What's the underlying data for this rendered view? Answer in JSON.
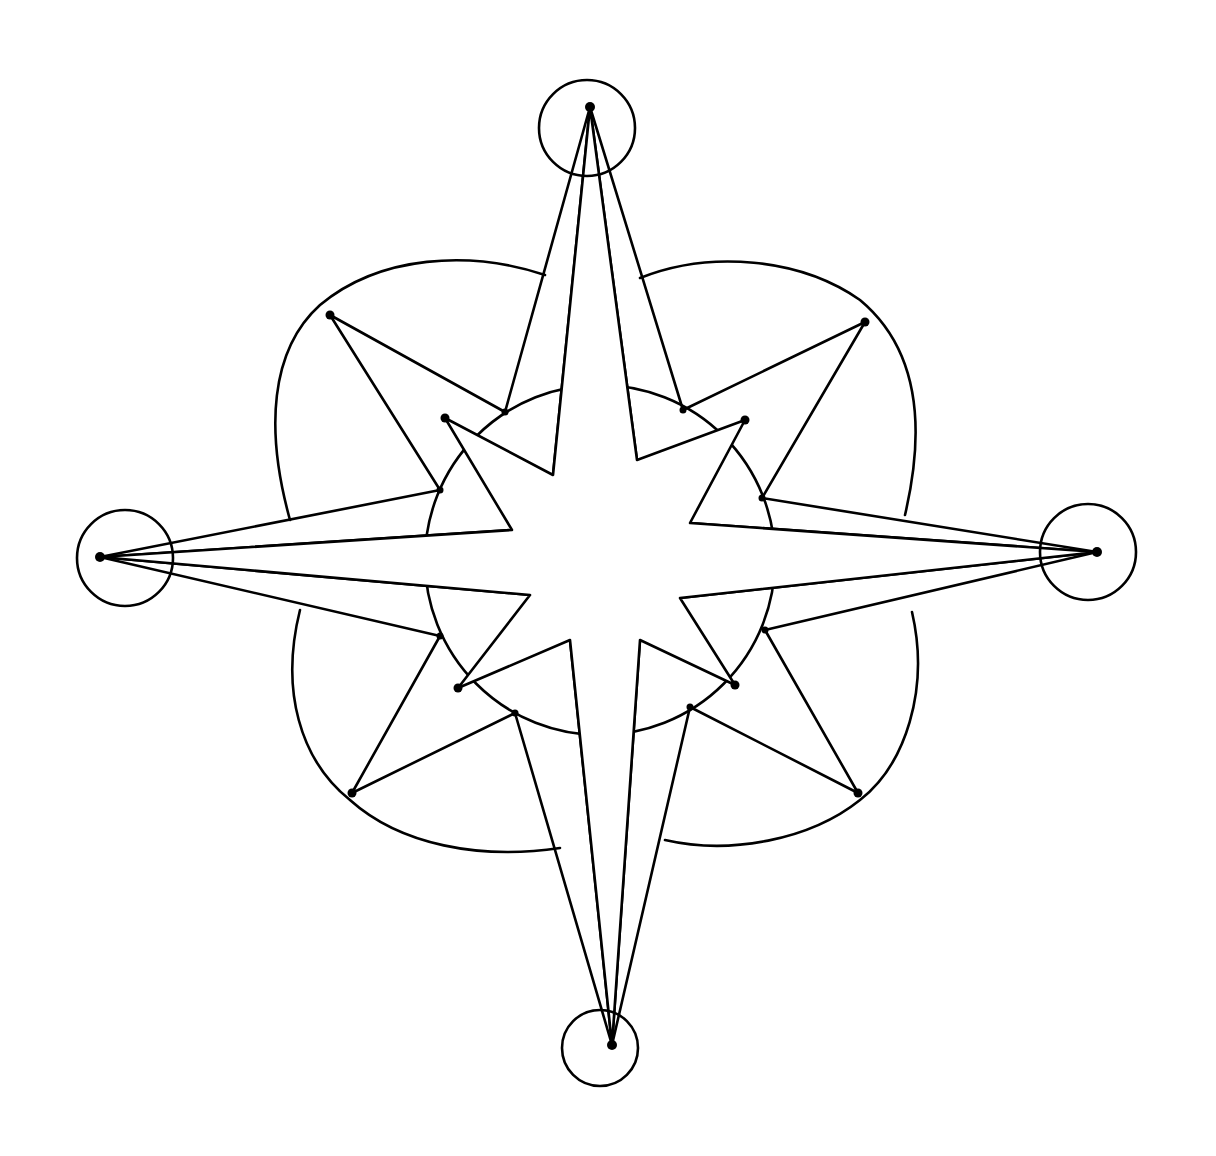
{
  "figure": {
    "title": "Compass rose line drawing",
    "colors": {
      "stroke": "#000000",
      "background": "#ffffff"
    },
    "center": [
      600,
      560
    ],
    "cardinal_tips": {
      "north": [
        590,
        107
      ],
      "south": [
        612,
        1045
      ],
      "west": [
        100,
        557
      ],
      "east": [
        1097,
        552
      ]
    },
    "cardinal_circle_radius": 48,
    "outer_diagonal_points": {
      "nw": [
        330,
        315
      ],
      "ne": [
        865,
        322
      ],
      "sw": [
        352,
        793
      ],
      "se": [
        858,
        793
      ]
    },
    "inner_diagonal_points": {
      "nw": [
        445,
        418
      ],
      "ne": [
        745,
        420
      ],
      "sw": [
        458,
        688
      ],
      "se": [
        735,
        685
      ]
    }
  }
}
